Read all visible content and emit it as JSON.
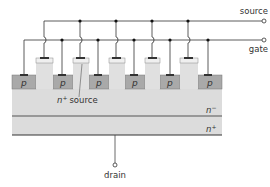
{
  "diagram": {
    "title": "",
    "terminals": {
      "source": "source",
      "gate": "gate",
      "drain": "drain"
    },
    "regions": {
      "p_label": "p",
      "n_plus_source": "n+ source",
      "n_plus_source_base": "n",
      "n_plus_source_sup": "+",
      "n_plus_source_word": "source",
      "n_minus_base": "n",
      "n_minus_sup": "−",
      "n_plus_base": "n",
      "n_plus_sup": "+"
    },
    "p_regions": [
      "p",
      "p",
      "p",
      "p",
      "p",
      "p"
    ],
    "colors": {
      "substrate": "#dcdcdc",
      "p_region": "#a9a9a9",
      "pillar": "#e6e6e6",
      "line": "#333333",
      "layer_line": "#555555"
    }
  }
}
